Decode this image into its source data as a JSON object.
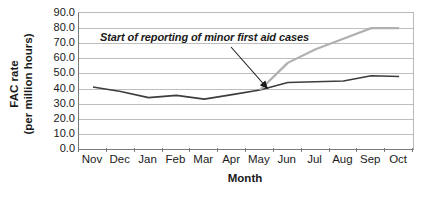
{
  "chart_data": {
    "type": "line",
    "title": "",
    "xlabel": "Month",
    "ylabel": "FAC rate (per million hours)",
    "ylabel_line1": "FAC rate",
    "ylabel_line2": "(per million hours)",
    "categories": [
      "Nov",
      "Dec",
      "Jan",
      "Feb",
      "Mar",
      "Apr",
      "May",
      "Jun",
      "Jul",
      "Aug",
      "Sep",
      "Oct"
    ],
    "x": [
      "Nov",
      "Dec",
      "Jan",
      "Feb",
      "Mar",
      "Apr",
      "May",
      "Jun",
      "Jul",
      "Aug",
      "Sep",
      "Oct"
    ],
    "ylim": [
      0.0,
      90.0
    ],
    "ytick_step": 10.0,
    "ytick_labels": [
      "90.0",
      "80.0",
      "70.0",
      "60.0",
      "50.0",
      "40.0",
      "30.0",
      "20.0",
      "10.0",
      "0.0"
    ],
    "ytick_values": [
      90.0,
      80.0,
      70.0,
      60.0,
      50.0,
      40.0,
      30.0,
      20.0,
      10.0,
      0.0
    ],
    "grid": true,
    "grid_axis": "y",
    "legend": false,
    "legend_position": "none",
    "series": [
      {
        "name": "FAC rate (recorded)",
        "color": "#3d3d3d",
        "width": 1.6,
        "values": [
          41.0,
          38.0,
          34.0,
          35.5,
          33.0,
          36.0,
          39.0,
          44.0,
          44.5,
          45.0,
          48.5,
          48.0
        ]
      },
      {
        "name": "FAC rate including minor first aid cases",
        "color": "#b0b0b0",
        "width": 2.2,
        "start_category": "May",
        "values": [
          null,
          null,
          null,
          null,
          null,
          null,
          39.0,
          57.0,
          66.0,
          73.0,
          80.0,
          80.0
        ]
      }
    ],
    "annotations": [
      {
        "text": "Start of reporting of minor first aid cases",
        "style": "italic",
        "label_x": 100,
        "label_y": 31,
        "arrow_from": [
          231,
          47
        ],
        "arrow_to": [
          268,
          89
        ],
        "target_category": "May",
        "target_value": 39.0
      }
    ]
  },
  "axes": {
    "y_title_line1": "FAC rate",
    "y_title_line2": "(per million hours)",
    "x_title": "Month"
  }
}
